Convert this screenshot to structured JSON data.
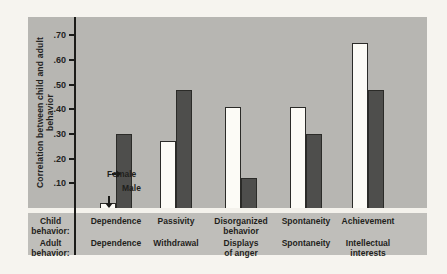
{
  "figure": {
    "ylabel": "Correlation between child and adult behavior",
    "row_headers": {
      "child": "Child\nbehavior:",
      "adult": "Adult\nbehavior:"
    },
    "annotations": {
      "female_label": "Female",
      "male_label": "Male"
    }
  },
  "chart_data": {
    "type": "bar",
    "title": "",
    "xlabel": "",
    "ylabel": "Correlation between child and adult behavior",
    "ylim": [
      0,
      0.75
    ],
    "grid": false,
    "legend_position": "inline-arrows-first-group",
    "yticks": [
      {
        "value": 0.7,
        "label": ".70"
      },
      {
        "value": 0.6,
        "label": ".60"
      },
      {
        "value": 0.5,
        "label": ".50"
      },
      {
        "value": 0.4,
        "label": ".40"
      },
      {
        "value": 0.3,
        "label": ".30"
      },
      {
        "value": 0.2,
        "label": ".20"
      },
      {
        "value": 0.1,
        "label": ".10"
      }
    ],
    "categories_child": [
      "Dependence",
      "Passivity",
      "Disorganized\nbehavior",
      "Spontaneity",
      "Achievement"
    ],
    "categories_adult": [
      "Dependence",
      "Withdrawal",
      "Displays\nof anger",
      "Spontaneity",
      "Intellectual\ninterests"
    ],
    "series": [
      {
        "name": "Male",
        "color": "#fcfbf6",
        "values": [
          0.02,
          0.27,
          0.41,
          0.41,
          0.67
        ]
      },
      {
        "name": "Female",
        "color": "#4e4e4c",
        "values": [
          0.3,
          0.48,
          0.12,
          0.3,
          0.48
        ]
      }
    ]
  },
  "colors": {
    "page_background": "#f6f4ef",
    "plot_background": "#b7b6b2",
    "label_band_background": "#bfbeba",
    "axis": "#1b1b19",
    "male_bar": "#fcfbf6",
    "female_bar": "#4e4e4c",
    "text": "#1f1f1c"
  }
}
